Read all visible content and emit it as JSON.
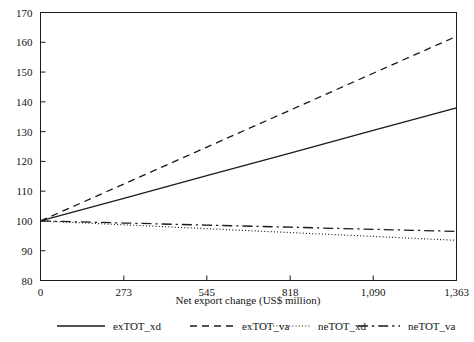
{
  "chart_data": {
    "type": "line",
    "title": "",
    "xlabel": "Net export change (US$ million)",
    "ylabel": "",
    "xlim": [
      0,
      1363
    ],
    "ylim": [
      80,
      170
    ],
    "grid": false,
    "legend_position": "bottom",
    "x_ticks": [
      0,
      273,
      545,
      818,
      1090,
      1363
    ],
    "x_tick_labels": [
      "0",
      "273",
      "545",
      "818",
      "1,090",
      "1,363"
    ],
    "y_ticks": [
      80,
      90,
      100,
      110,
      120,
      130,
      140,
      150,
      160,
      170
    ],
    "y_tick_labels": [
      "80",
      "90",
      "100",
      "110",
      "120",
      "130",
      "140",
      "150",
      "160",
      "170"
    ],
    "x": [
      0,
      273,
      545,
      818,
      1090,
      1363
    ],
    "series": [
      {
        "name": "exTOT_xd",
        "style": "solid",
        "color": "#1a1a1a",
        "values": [
          100.0,
          107.6,
          115.2,
          122.8,
          130.4,
          138.0
        ]
      },
      {
        "name": "exTOT_va",
        "style": "dashed",
        "color": "#1a1a1a",
        "values": [
          100.0,
          112.4,
          124.8,
          137.2,
          149.6,
          162.0
        ]
      },
      {
        "name": "neTOT_xd",
        "style": "dotted",
        "color": "#1a1a1a",
        "values": [
          100.0,
          98.7,
          97.4,
          96.1,
          94.8,
          93.5
        ]
      },
      {
        "name": "neTOT_va",
        "style": "dashdot",
        "color": "#1a1a1a",
        "values": [
          100.0,
          99.3,
          98.6,
          97.9,
          97.2,
          96.5
        ]
      }
    ]
  },
  "legend": {
    "items": [
      {
        "label": "exTOT_xd",
        "style": "solid"
      },
      {
        "label": "exTOT_va",
        "style": "dashed"
      },
      {
        "label": "neTOT_xd",
        "style": "dotted"
      },
      {
        "label": "neTOT_va",
        "style": "dashdot"
      }
    ]
  },
  "axis": {
    "x_title": "Net export change (US$ million)"
  }
}
